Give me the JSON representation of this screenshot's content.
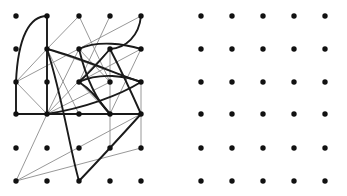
{
  "figure": {
    "title": "",
    "width": 347,
    "height": 196,
    "background": "#ffffff"
  },
  "chart_data": {
    "type": "scatter",
    "title": "",
    "subtitle": "",
    "xlabel": "",
    "ylabel": "",
    "grid": false,
    "legend": null,
    "xlim": [
      0,
      347
    ],
    "ylim": [
      0,
      196
    ],
    "panels": [
      {
        "name": "left-panel",
        "label": "graph-drawing",
        "origin": [
          16,
          16
        ],
        "columns": 5,
        "rows": 6,
        "dx": 31.25,
        "dy": 33.0,
        "node_color": "#111111",
        "node_radius": 2.7,
        "nodes": [
          {
            "id": "a0",
            "col": 0,
            "row": 0,
            "x": 16,
            "y": 16
          },
          {
            "id": "a1",
            "col": 1,
            "row": 0,
            "x": 47,
            "y": 16
          },
          {
            "id": "a2",
            "col": 2,
            "row": 0,
            "x": 79,
            "y": 16
          },
          {
            "id": "a3",
            "col": 3,
            "row": 0,
            "x": 110,
            "y": 16
          },
          {
            "id": "a4",
            "col": 4,
            "row": 0,
            "x": 141,
            "y": 16
          },
          {
            "id": "b0",
            "col": 0,
            "row": 1,
            "x": 16,
            "y": 49
          },
          {
            "id": "b1",
            "col": 1,
            "row": 1,
            "x": 47,
            "y": 49
          },
          {
            "id": "b2",
            "col": 2,
            "row": 1,
            "x": 79,
            "y": 49
          },
          {
            "id": "b3",
            "col": 3,
            "row": 1,
            "x": 110,
            "y": 49
          },
          {
            "id": "b4",
            "col": 4,
            "row": 1,
            "x": 141,
            "y": 49
          },
          {
            "id": "c0",
            "col": 0,
            "row": 2,
            "x": 16,
            "y": 82
          },
          {
            "id": "c1",
            "col": 1,
            "row": 2,
            "x": 47,
            "y": 82
          },
          {
            "id": "c2",
            "col": 2,
            "row": 2,
            "x": 79,
            "y": 82
          },
          {
            "id": "c3",
            "col": 3,
            "row": 2,
            "x": 110,
            "y": 82
          },
          {
            "id": "c4",
            "col": 4,
            "row": 2,
            "x": 141,
            "y": 82
          },
          {
            "id": "d0",
            "col": 0,
            "row": 3,
            "x": 16,
            "y": 114
          },
          {
            "id": "d1",
            "col": 1,
            "row": 3,
            "x": 47,
            "y": 114
          },
          {
            "id": "d2",
            "col": 2,
            "row": 3,
            "x": 79,
            "y": 114
          },
          {
            "id": "d3",
            "col": 3,
            "row": 3,
            "x": 110,
            "y": 114
          },
          {
            "id": "d4",
            "col": 4,
            "row": 3,
            "x": 141,
            "y": 114
          },
          {
            "id": "e0",
            "col": 0,
            "row": 4,
            "x": 16,
            "y": 148
          },
          {
            "id": "e1",
            "col": 1,
            "row": 4,
            "x": 47,
            "y": 148
          },
          {
            "id": "e2",
            "col": 2,
            "row": 4,
            "x": 79,
            "y": 148
          },
          {
            "id": "e3",
            "col": 3,
            "row": 4,
            "x": 110,
            "y": 148
          },
          {
            "id": "e4",
            "col": 4,
            "row": 4,
            "x": 141,
            "y": 148
          },
          {
            "id": "f0",
            "col": 0,
            "row": 5,
            "x": 16,
            "y": 181
          },
          {
            "id": "f1",
            "col": 1,
            "row": 5,
            "x": 47,
            "y": 181
          },
          {
            "id": "f2",
            "col": 2,
            "row": 5,
            "x": 79,
            "y": 181
          },
          {
            "id": "f3",
            "col": 3,
            "row": 5,
            "x": 110,
            "y": 181
          },
          {
            "id": "f4",
            "col": 4,
            "row": 5,
            "x": 141,
            "y": 181
          }
        ],
        "thin_edge_color": "#8c8c8c",
        "thin_edge_width": 0.9,
        "thin_edges": [
          {
            "from": "a1",
            "to": "b1",
            "d": "M 47 16 L 47 49"
          },
          {
            "from": "a2",
            "to": "b1",
            "d": "M 79 16 L 47 49"
          },
          {
            "from": "a2",
            "to": "c3",
            "d": "M 79 16 L 110 82"
          },
          {
            "from": "a3",
            "to": "c2",
            "d": "M 110 16 L 79 82"
          },
          {
            "from": "a4",
            "to": "c0",
            "d": "M 141 16 L 16 82"
          },
          {
            "from": "b1",
            "to": "c0",
            "d": "M 47 49 L 16 82"
          },
          {
            "from": "b1",
            "to": "d2",
            "d": "M 47 49 L 79 114"
          },
          {
            "from": "b1",
            "to": "d1",
            "d": "M 47 49 L 47 114"
          },
          {
            "from": "b1",
            "to": "c4",
            "d": "M 47 49 L 141 82"
          },
          {
            "from": "b2",
            "to": "c3",
            "d": "M 79 49 L 110 82"
          },
          {
            "from": "b2",
            "to": "d1",
            "d": "M 79 49 L 47 114"
          },
          {
            "from": "b3",
            "to": "c2",
            "d": "M 110 49 L 79 82"
          },
          {
            "from": "b3",
            "to": "e3",
            "d": "M 110 49 L 110 148"
          },
          {
            "from": "b3",
            "to": "d1",
            "d": "M 110 49 L 47 114"
          },
          {
            "from": "b4",
            "to": "c2",
            "d": "M 141 49 L 79 82"
          },
          {
            "from": "c0",
            "to": "d0",
            "d": "M 16 82 L 16 114"
          },
          {
            "from": "c0",
            "to": "d1",
            "d": "M 16 82 L 47 114"
          },
          {
            "from": "c2",
            "to": "d3",
            "d": "M 79 82 L 110 114"
          },
          {
            "from": "c3",
            "to": "d1",
            "d": "M 110 82 L 47 114"
          },
          {
            "from": "c4",
            "to": "e4",
            "d": "M 141 82 L 141 148"
          },
          {
            "from": "d0",
            "to": "d1",
            "d": "M 16 114 L 47 114"
          },
          {
            "from": "d1",
            "to": "f0",
            "d": "M 47 114 L 16 181"
          },
          {
            "from": "d4",
            "to": "f0",
            "d": "M 141 114 L 16 181"
          },
          {
            "from": "e4",
            "to": "f0",
            "d": "M 141 148 L 16 181"
          },
          {
            "from": "d3",
            "to": "d1",
            "d": "M 110 114 L 47 114"
          },
          {
            "from": "b4",
            "to": "d3",
            "d": "M 141 49 L 110 114"
          }
        ],
        "thick_edge_color": "#1a1a1a",
        "thick_edge_width": 1.9,
        "thick_edges": [
          {
            "from": "c0",
            "to": "a1",
            "d": "M 16 82 C 18 36 30 16 47 16"
          },
          {
            "from": "a1",
            "to": "d1",
            "d": "M 47 16 C 47 52 47 86 47 114"
          },
          {
            "from": "b1",
            "to": "f2",
            "d": "M 47 49 C 62 95 70 150 79 181"
          },
          {
            "from": "c0",
            "to": "d0",
            "d": "M 16 82 L 16 114"
          },
          {
            "from": "c0",
            "to": "d1",
            "d": "M 16 114 L 47 114"
          },
          {
            "from": "a4",
            "to": "b3",
            "d": "M 141 16 C 139 36 126 48 110 49"
          },
          {
            "from": "b2",
            "to": "b4",
            "d": "M 79 49 C 98 40 125 44 141 49"
          },
          {
            "from": "b2",
            "to": "d3",
            "d": "M 79 49 C 86 78 96 100 110 114"
          },
          {
            "from": "b3",
            "to": "c2",
            "d": "M 110 49 C 99 62 88 74 79 82"
          },
          {
            "from": "b3",
            "to": "d4",
            "d": "M 110 49 C 122 72 133 96 141 114"
          },
          {
            "from": "c2",
            "to": "c4",
            "d": "M 79 82 C 100 72 126 76 141 82"
          },
          {
            "from": "b1",
            "to": "c4",
            "d": "M 47 49 C 82 58 116 74 141 82"
          },
          {
            "from": "d1",
            "to": "c4",
            "d": "M 47 114 C 85 108 120 95 141 82"
          },
          {
            "from": "d4",
            "to": "f2",
            "d": "M 141 114 C 122 135 99 160 79 181"
          },
          {
            "from": "d1",
            "to": "d4",
            "d": "M 47 114 L 141 114"
          },
          {
            "from": "c2",
            "to": "d3",
            "d": "M 79 82 C 92 90 101 103 110 114"
          }
        ]
      },
      {
        "name": "right-panel",
        "label": "empty-lattice",
        "origin": [
          201,
          16
        ],
        "columns": 5,
        "rows": 6,
        "dx": 31.0,
        "dy": 33.0,
        "node_color": "#111111",
        "node_radius": 2.7,
        "nodes": [
          {
            "id": "A0",
            "col": 0,
            "row": 0,
            "x": 201,
            "y": 16
          },
          {
            "id": "A1",
            "col": 1,
            "row": 0,
            "x": 232,
            "y": 16
          },
          {
            "id": "A2",
            "col": 2,
            "row": 0,
            "x": 263,
            "y": 16
          },
          {
            "id": "A3",
            "col": 3,
            "row": 0,
            "x": 294,
            "y": 16
          },
          {
            "id": "A4",
            "col": 4,
            "row": 0,
            "x": 325,
            "y": 16
          },
          {
            "id": "B0",
            "col": 0,
            "row": 1,
            "x": 201,
            "y": 49
          },
          {
            "id": "B1",
            "col": 1,
            "row": 1,
            "x": 232,
            "y": 49
          },
          {
            "id": "B2",
            "col": 2,
            "row": 1,
            "x": 263,
            "y": 49
          },
          {
            "id": "B3",
            "col": 3,
            "row": 1,
            "x": 294,
            "y": 49
          },
          {
            "id": "B4",
            "col": 4,
            "row": 1,
            "x": 325,
            "y": 49
          },
          {
            "id": "C0",
            "col": 0,
            "row": 2,
            "x": 201,
            "y": 82
          },
          {
            "id": "C1",
            "col": 1,
            "row": 2,
            "x": 232,
            "y": 82
          },
          {
            "id": "C2",
            "col": 2,
            "row": 2,
            "x": 263,
            "y": 82
          },
          {
            "id": "C3",
            "col": 3,
            "row": 2,
            "x": 294,
            "y": 82
          },
          {
            "id": "C4",
            "col": 4,
            "row": 2,
            "x": 325,
            "y": 82
          },
          {
            "id": "D0",
            "col": 0,
            "row": 3,
            "x": 201,
            "y": 114
          },
          {
            "id": "D1",
            "col": 1,
            "row": 3,
            "x": 232,
            "y": 114
          },
          {
            "id": "D2",
            "col": 2,
            "row": 3,
            "x": 263,
            "y": 114
          },
          {
            "id": "D3",
            "col": 3,
            "row": 3,
            "x": 294,
            "y": 114
          },
          {
            "id": "D4",
            "col": 4,
            "row": 3,
            "x": 325,
            "y": 114
          },
          {
            "id": "E0",
            "col": 0,
            "row": 4,
            "x": 201,
            "y": 148
          },
          {
            "id": "E1",
            "col": 1,
            "row": 4,
            "x": 232,
            "y": 148
          },
          {
            "id": "E2",
            "col": 2,
            "row": 4,
            "x": 263,
            "y": 148
          },
          {
            "id": "E3",
            "col": 3,
            "row": 4,
            "x": 294,
            "y": 148
          },
          {
            "id": "E4",
            "col": 4,
            "row": 4,
            "x": 325,
            "y": 148
          },
          {
            "id": "F0",
            "col": 0,
            "row": 5,
            "x": 201,
            "y": 181
          },
          {
            "id": "F1",
            "col": 1,
            "row": 5,
            "x": 232,
            "y": 181
          },
          {
            "id": "F2",
            "col": 2,
            "row": 5,
            "x": 263,
            "y": 181
          },
          {
            "id": "F3",
            "col": 3,
            "row": 5,
            "x": 294,
            "y": 181
          },
          {
            "id": "F4",
            "col": 4,
            "row": 5,
            "x": 325,
            "y": 181
          }
        ],
        "thin_edges": [],
        "thick_edges": []
      }
    ]
  }
}
